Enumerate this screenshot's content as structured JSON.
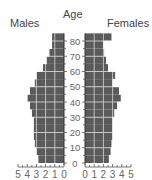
{
  "chart_data": {
    "type": "bar",
    "subtype": "population-pyramid",
    "title": "",
    "ylabel": "Age",
    "left_label": "Males",
    "right_label": "Females",
    "categories": [
      "0-4",
      "5-9",
      "10-14",
      "15-19",
      "20-24",
      "25-29",
      "30-34",
      "35-39",
      "40-44",
      "45-49",
      "50-54",
      "55-59",
      "60-64",
      "65-69",
      "70-74",
      "75-79",
      "80+"
    ],
    "series": [
      {
        "name": "Males",
        "values": [
          2.8,
          3.0,
          3.2,
          3.3,
          3.3,
          3.3,
          3.5,
          3.7,
          4.0,
          3.7,
          3.2,
          3.0,
          2.3,
          1.9,
          1.6,
          1.3,
          1.3
        ]
      },
      {
        "name": "Females",
        "values": [
          2.6,
          2.8,
          2.9,
          3.0,
          3.0,
          3.0,
          3.2,
          3.5,
          3.9,
          3.7,
          3.0,
          3.3,
          2.5,
          2.3,
          2.1,
          2.0,
          2.9
        ]
      }
    ],
    "y_ticks": [
      0,
      10,
      20,
      30,
      40,
      50,
      60,
      70,
      80
    ],
    "x_ticks_left": [
      "5",
      "4",
      "3",
      "2",
      "1",
      "0"
    ],
    "x_ticks_right": [
      "0",
      "1",
      "2",
      "3",
      "4",
      "5"
    ],
    "xlim": [
      0,
      5
    ],
    "grid": true,
    "bar_color": "#5a5a5a",
    "grid_color": "#d8d8d8"
  }
}
